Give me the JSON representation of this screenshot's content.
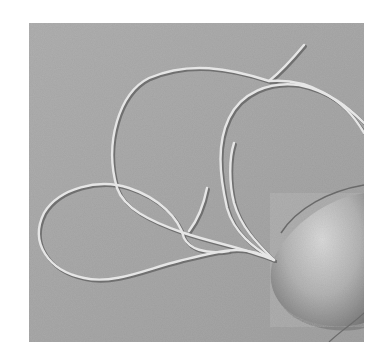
{
  "image": {
    "subject": "flagellated bacterium electron micrograph",
    "description": "Grayscale shadowed electron micrograph showing a bacterial cell body at lower right with multiple long flagella looping across a textured substrate",
    "colors": {
      "background": "#ffffff",
      "substrate": "#a9a9a9",
      "substrate_light": "#b8b8b8",
      "flagella_highlight": "#e6e6e6",
      "flagella_shadow": "#6e6e6e",
      "cell_body_light": "#d2d2d2",
      "cell_body_dark": "#7a7a7a"
    }
  }
}
